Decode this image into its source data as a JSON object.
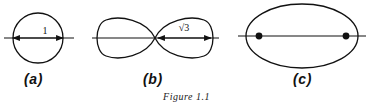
{
  "figure": {
    "caption": "Figure 1.1",
    "panels": [
      {
        "id": "a",
        "label": "(a)",
        "shape": "circle",
        "measure_label": "1",
        "measure_meaning": "radius"
      },
      {
        "id": "b",
        "label": "(b)",
        "shape": "lemniscate",
        "measure_label": "√3",
        "measure_meaning": "half-width"
      },
      {
        "id": "c",
        "label": "(c)",
        "shape": "ellipse",
        "measure_label": "",
        "measure_meaning": "foci marked"
      }
    ]
  },
  "colors": {
    "ink": "#111111",
    "background": "#ffffff"
  }
}
